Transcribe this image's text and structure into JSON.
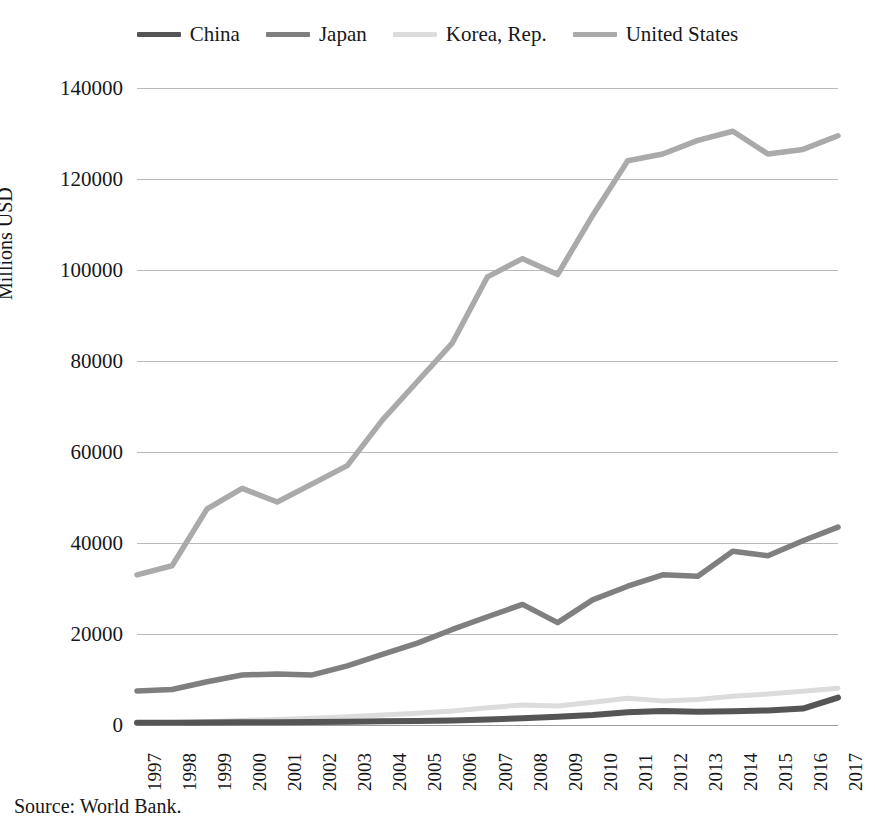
{
  "figure": {
    "top_caption_fragment": "",
    "source_note": "Source: World Bank."
  },
  "legend": {
    "position": "top-center",
    "items": [
      {
        "label": "China",
        "color": "#555555",
        "series_key": "china"
      },
      {
        "label": "Japan",
        "color": "#7f7f7f",
        "series_key": "japan"
      },
      {
        "label": "Korea, Rep.",
        "color": "#dcdcdc",
        "series_key": "korea"
      },
      {
        "label": "United States",
        "color": "#aaaaaa",
        "series_key": "united_states"
      }
    ]
  },
  "axes": {
    "y_title": "Millions USD",
    "y_ticks": [
      "0",
      "20000",
      "40000",
      "60000",
      "80000",
      "100000",
      "120000",
      "140000"
    ],
    "y_min": 0,
    "y_max": 140000,
    "x_ticks": [
      "1997",
      "1998",
      "1999",
      "2000",
      "2001",
      "2002",
      "2003",
      "2004",
      "2005",
      "2006",
      "2007",
      "2008",
      "2009",
      "2010",
      "2011",
      "2012",
      "2013",
      "2014",
      "2015",
      "2016",
      "2017"
    ],
    "grid": "horizontal-only"
  },
  "chart_data": {
    "type": "line",
    "title": "",
    "xlabel": "",
    "ylabel": "Millions USD",
    "ylim": [
      0,
      140000
    ],
    "grid": true,
    "legend_position": "top-center",
    "x": [
      1997,
      1998,
      1999,
      2000,
      2001,
      2002,
      2003,
      2004,
      2005,
      2006,
      2007,
      2008,
      2009,
      2010,
      2011,
      2012,
      2013,
      2014,
      2015,
      2016,
      2017
    ],
    "categories": [
      "1997",
      "1998",
      "1999",
      "2000",
      "2001",
      "2002",
      "2003",
      "2004",
      "2005",
      "2006",
      "2007",
      "2008",
      "2009",
      "2010",
      "2011",
      "2012",
      "2013",
      "2014",
      "2015",
      "2016",
      "2017"
    ],
    "series": [
      {
        "name": "China",
        "color": "#555555",
        "values": [
          500,
          500,
          550,
          600,
          600,
          650,
          700,
          800,
          900,
          1000,
          1200,
          1500,
          1800,
          2200,
          2800,
          3100,
          2900,
          3000,
          3200,
          3600,
          6000
        ]
      },
      {
        "name": "Japan",
        "color": "#7f7f7f",
        "values": [
          7500,
          7800,
          9500,
          11000,
          11200,
          11000,
          13000,
          15500,
          18000,
          21000,
          23800,
          26500,
          22500,
          27500,
          30500,
          33000,
          32700,
          38200,
          37200,
          40500,
          43500
        ]
      },
      {
        "name": "Korea, Rep.",
        "color": "#dcdcdc",
        "values": [
          400,
          350,
          700,
          1000,
          1200,
          1500,
          1800,
          2200,
          2600,
          3100,
          3800,
          4400,
          4200,
          5000,
          5900,
          5300,
          5600,
          6300,
          6800,
          7400,
          8100
        ]
      },
      {
        "name": "United States",
        "color": "#aaaaaa",
        "values": [
          33000,
          35000,
          47500,
          52000,
          49000,
          53000,
          57000,
          67000,
          75500,
          84000,
          98500,
          102500,
          99000,
          112000,
          124000,
          125500,
          128500,
          130500,
          125500,
          126500,
          129500
        ]
      }
    ]
  }
}
